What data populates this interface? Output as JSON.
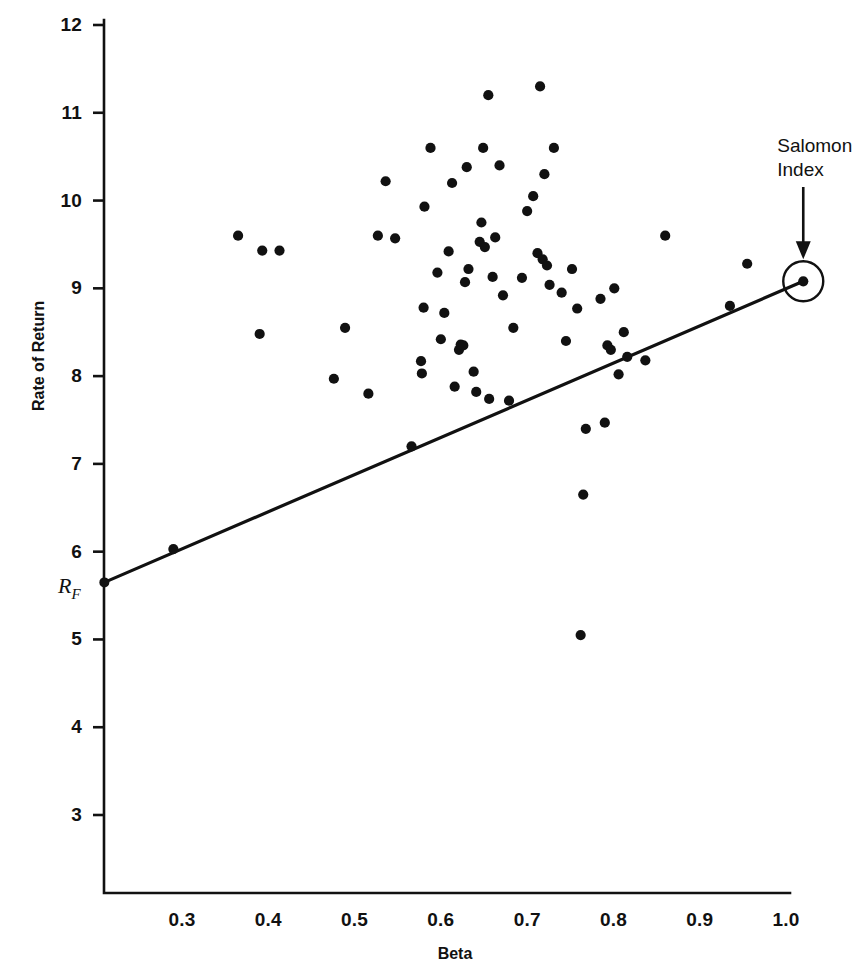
{
  "chart_data": {
    "type": "scatter",
    "title": "",
    "xlabel": "Beta",
    "ylabel": "Rate of Return",
    "xlim": [
      0.21,
      1.06
    ],
    "ylim": [
      2.55,
      12.0
    ],
    "grid": false,
    "legend": null,
    "xticks": [
      "0.3",
      "0.4",
      "0.5",
      "0.6",
      "0.7",
      "0.8",
      "0.9",
      "1.0"
    ],
    "xtick_values": [
      0.3,
      0.4,
      0.5,
      0.6,
      0.7,
      0.8,
      0.9,
      1.0
    ],
    "yticks": [
      "3",
      "4",
      "5",
      "6",
      "7",
      "8",
      "9",
      "10",
      "11",
      "12"
    ],
    "ytick_values": [
      3,
      4,
      5,
      6,
      7,
      8,
      9,
      10,
      11,
      12
    ],
    "special_axis_label": {
      "text": "R",
      "subscript": "F",
      "y_value": 5.65,
      "description": "risk-free rate intercept marker on vertical axis"
    },
    "annotations": [
      {
        "text_lines": [
          "Salomon",
          "Index"
        ],
        "arrow": "down",
        "points_to_x": 1.02,
        "points_to_y": 9.08,
        "marker": "circled-point"
      }
    ],
    "series": [
      {
        "name": "Security Market Line",
        "type": "line",
        "points": [
          [
            0.21,
            5.65
          ],
          [
            1.02,
            9.08
          ]
        ],
        "color": "#111111",
        "linewidth": 3.2
      },
      {
        "name": "Salomon Index",
        "type": "scatter",
        "marker": "circled-dot",
        "color": "#111111",
        "points": [
          [
            1.02,
            9.08
          ]
        ]
      },
      {
        "name": "Portfolios",
        "type": "scatter",
        "marker": "filled-circle",
        "color": "#111111",
        "points": [
          [
            0.365,
            9.6
          ],
          [
            0.393,
            9.43
          ],
          [
            0.413,
            9.43
          ],
          [
            0.39,
            8.48
          ],
          [
            0.476,
            7.97
          ],
          [
            0.489,
            8.55
          ],
          [
            0.516,
            7.8
          ],
          [
            0.527,
            9.6
          ],
          [
            0.547,
            9.57
          ],
          [
            0.536,
            10.22
          ],
          [
            0.566,
            7.2
          ],
          [
            0.578,
            8.03
          ],
          [
            0.577,
            8.17
          ],
          [
            0.58,
            8.78
          ],
          [
            0.581,
            9.93
          ],
          [
            0.588,
            10.6
          ],
          [
            0.596,
            9.18
          ],
          [
            0.6,
            8.42
          ],
          [
            0.604,
            8.72
          ],
          [
            0.609,
            9.42
          ],
          [
            0.613,
            10.2
          ],
          [
            0.616,
            7.88
          ],
          [
            0.621,
            8.3
          ],
          [
            0.623,
            8.36
          ],
          [
            0.626,
            8.35
          ],
          [
            0.628,
            9.07
          ],
          [
            0.63,
            10.38
          ],
          [
            0.632,
            9.22
          ],
          [
            0.638,
            8.05
          ],
          [
            0.641,
            7.82
          ],
          [
            0.645,
            9.53
          ],
          [
            0.647,
            9.75
          ],
          [
            0.649,
            10.6
          ],
          [
            0.651,
            9.47
          ],
          [
            0.655,
            11.2
          ],
          [
            0.656,
            7.74
          ],
          [
            0.66,
            9.13
          ],
          [
            0.663,
            9.58
          ],
          [
            0.668,
            10.4
          ],
          [
            0.672,
            8.92
          ],
          [
            0.679,
            7.72
          ],
          [
            0.684,
            8.55
          ],
          [
            0.694,
            9.12
          ],
          [
            0.7,
            9.88
          ],
          [
            0.707,
            10.05
          ],
          [
            0.712,
            9.4
          ],
          [
            0.715,
            11.3
          ],
          [
            0.718,
            9.33
          ],
          [
            0.72,
            10.3
          ],
          [
            0.723,
            9.26
          ],
          [
            0.726,
            9.04
          ],
          [
            0.731,
            10.6
          ],
          [
            0.74,
            8.95
          ],
          [
            0.745,
            8.4
          ],
          [
            0.752,
            9.22
          ],
          [
            0.758,
            8.77
          ],
          [
            0.762,
            5.05
          ],
          [
            0.765,
            6.65
          ],
          [
            0.768,
            7.4
          ],
          [
            0.785,
            8.88
          ],
          [
            0.79,
            7.47
          ],
          [
            0.793,
            8.35
          ],
          [
            0.797,
            8.3
          ],
          [
            0.801,
            9.0
          ],
          [
            0.806,
            8.02
          ],
          [
            0.812,
            8.5
          ],
          [
            0.816,
            8.22
          ],
          [
            0.837,
            8.18
          ],
          [
            0.86,
            9.6
          ],
          [
            0.935,
            8.8
          ],
          [
            0.955,
            9.28
          ],
          [
            0.29,
            6.03
          ]
        ]
      }
    ]
  },
  "axis": {
    "y_title": "Rate of Return",
    "x_title": "Beta"
  },
  "annotation": {
    "line1": "Salomon",
    "line2": "Index"
  },
  "rf": {
    "base": "R",
    "sub": "F"
  },
  "colors": {
    "ink": "#111111",
    "background": "#ffffff"
  }
}
